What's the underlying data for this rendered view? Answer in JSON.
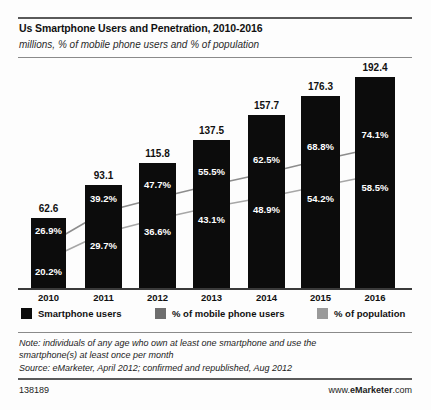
{
  "header": {
    "title": "Us Smartphone Users and Penetration, 2010-2016",
    "subtitle": "millions, % of mobile phone users and % of population"
  },
  "legend": {
    "items": [
      {
        "label": "Smartphone users",
        "color": "#0c0c0c"
      },
      {
        "label": "% of mobile phone users",
        "color": "#6e6e6e"
      },
      {
        "label": "% of population",
        "color": "#9a9a9a"
      }
    ]
  },
  "footer": {
    "note_line1": "Note: individuals of any age who own at least one smartphone and use the",
    "note_line2": "smartphone(s) at least once per month",
    "source": "Source: eMarketer, April 2012; confirmed and republished, Aug 2012",
    "id": "138189",
    "url_prefix": "www.",
    "url_brand": "eMarketer",
    "url_suffix": ".com"
  },
  "chart_data": {
    "type": "bar",
    "title": "Us Smartphone Users and Penetration, 2010-2016",
    "subtitle": "millions, % of mobile phone users and % of population",
    "xlabel": "",
    "ylabel": "",
    "grid": false,
    "legend_position": "bottom",
    "categories": [
      "2010",
      "2011",
      "2012",
      "2013",
      "2014",
      "2015",
      "2016"
    ],
    "ylim": [
      0,
      200
    ],
    "series": [
      {
        "name": "Smartphone users",
        "type": "bar",
        "unit": "millions",
        "color": "#0c0c0c",
        "values": [
          62.6,
          93.1,
          115.8,
          137.5,
          157.7,
          176.3,
          192.4
        ],
        "labels": [
          "62.6",
          "93.1",
          "115.8",
          "137.5",
          "157.7",
          "176.3",
          "192.4"
        ]
      },
      {
        "name": "% of mobile phone users",
        "type": "line",
        "unit": "percent",
        "color": "#6e6e6e",
        "values": [
          26.9,
          39.2,
          47.7,
          55.5,
          62.5,
          68.8,
          74.1
        ],
        "labels": [
          "26.9%",
          "39.2%",
          "47.7%",
          "55.5%",
          "62.5%",
          "68.8%",
          "74.1%"
        ]
      },
      {
        "name": "% of population",
        "type": "line",
        "unit": "percent",
        "color": "#9a9a9a",
        "values": [
          20.2,
          29.7,
          36.6,
          43.1,
          48.9,
          54.2,
          58.5
        ],
        "labels": [
          "20.2%",
          "29.7%",
          "36.6%",
          "43.1%",
          "48.9%",
          "54.2%",
          "58.5%"
        ]
      }
    ]
  },
  "geometry": {
    "bars": [
      {
        "x": 31,
        "w": 35,
        "top": 218
      },
      {
        "x": 85,
        "w": 37,
        "top": 185
      },
      {
        "x": 139,
        "w": 37,
        "top": 163
      },
      {
        "x": 193,
        "w": 37,
        "top": 140
      },
      {
        "x": 248,
        "w": 37,
        "top": 115
      },
      {
        "x": 301,
        "w": 39,
        "top": 96
      },
      {
        "x": 355,
        "w": 40,
        "top": 77
      }
    ],
    "baseline": 288,
    "mobile_pts_y": [
      244,
      212,
      198,
      185,
      173,
      160,
      148
    ],
    "pop_pts_y": [
      259,
      233,
      219,
      207,
      197,
      186,
      175
    ]
  }
}
